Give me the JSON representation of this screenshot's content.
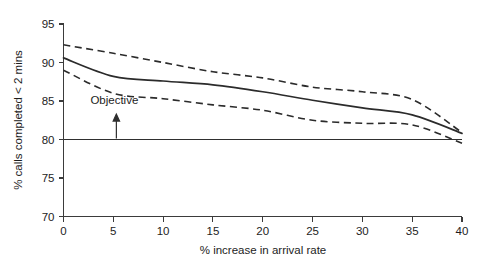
{
  "chart_data": {
    "type": "line",
    "title": "",
    "subtitle": "",
    "xlabel": "% increase in arrival rate",
    "ylabel": "% calls completed < 2 mins",
    "xlim": [
      0,
      40
    ],
    "ylim": [
      70,
      95
    ],
    "xticks": [
      0,
      5,
      10,
      15,
      20,
      25,
      30,
      35,
      40
    ],
    "yticks": [
      70,
      75,
      80,
      85,
      90,
      95
    ],
    "xtick_labels": [
      "0",
      "5",
      "10",
      "15",
      "20",
      "25",
      "30",
      "35",
      "40"
    ],
    "ytick_labels": [
      "70",
      "75",
      "80",
      "85",
      "90",
      "95"
    ],
    "grid": false,
    "legend": "none",
    "x": [
      0,
      5,
      10,
      15,
      20,
      25,
      30,
      35,
      40
    ],
    "series": [
      {
        "name": "Upper confidence limit",
        "style": "dashed",
        "values": [
          92.3,
          91.2,
          90.0,
          88.8,
          88.0,
          86.8,
          86.2,
          85.2,
          80.9
        ]
      },
      {
        "name": "Mean % calls completed",
        "style": "solid",
        "values": [
          90.6,
          88.2,
          87.6,
          87.1,
          86.2,
          85.1,
          84.1,
          83.2,
          80.8
        ]
      },
      {
        "name": "Lower confidence limit",
        "style": "dashed",
        "values": [
          89.0,
          86.0,
          85.3,
          84.5,
          83.8,
          82.5,
          82.1,
          81.9,
          79.5
        ]
      },
      {
        "name": "Objective",
        "style": "solid-reference",
        "constant": 80.0
      }
    ],
    "annotations": [
      {
        "name": "objective",
        "text": "Objective",
        "x": 3.3,
        "y": 84.6,
        "arrow_to_y": 80.0
      }
    ],
    "colors": {
      "series": "#2b2b2b",
      "axis": "#3b3b3b",
      "text": "#1d1d1d",
      "background": "#ffffff"
    }
  }
}
